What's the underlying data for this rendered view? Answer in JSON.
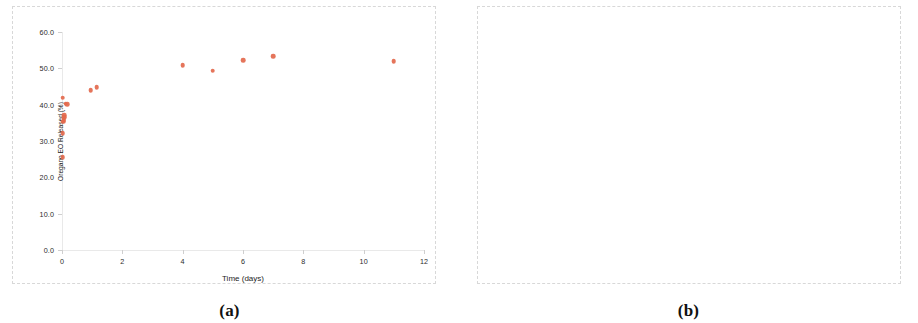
{
  "figure": {
    "marker_color": "#e3694d",
    "background": "#ffffff",
    "panels": [
      {
        "caption": "(a)",
        "chart_data": {
          "type": "scatter",
          "title": "",
          "xlabel": "Time (days)",
          "ylabel": "Oregano EO Released (%)",
          "xlim": [
            0,
            12
          ],
          "ylim": [
            0,
            60
          ],
          "xticks": [
            "0",
            "2",
            "4",
            "6",
            "8",
            "10",
            "12"
          ],
          "xtick_values": [
            0,
            2,
            4,
            6,
            8,
            10,
            12
          ],
          "yticks": [
            "0.0",
            "10.0",
            "20.0",
            "30.0",
            "40.0",
            "50.0",
            "60.0"
          ],
          "ytick_values": [
            0,
            10,
            20,
            30,
            40,
            50,
            60
          ],
          "grid": false,
          "legend": "none",
          "marker": "circle",
          "series": [
            {
              "name": "Oregano EO release",
              "points": [
                [
                  0.02,
                  25.5
                ],
                [
                  0.03,
                  32.2
                ],
                [
                  0.04,
                  35.3
                ],
                [
                  0.05,
                  35.6
                ],
                [
                  0.06,
                  36.0
                ],
                [
                  0.07,
                  36.6
                ],
                [
                  0.08,
                  37.1
                ],
                [
                  0.03,
                  41.9
                ],
                [
                  0.12,
                  40.3
                ],
                [
                  0.18,
                  40.2
                ],
                [
                  0.95,
                  44.0
                ],
                [
                  1.15,
                  44.8
                ],
                [
                  4.0,
                  50.9
                ],
                [
                  5.0,
                  49.4
                ],
                [
                  6.0,
                  52.2
                ],
                [
                  7.0,
                  53.4
                ],
                [
                  11.0,
                  51.9
                ]
              ]
            }
          ]
        }
      },
      {
        "caption": "(b)",
        "chart_data": {
          "type": "scatter",
          "title": "",
          "xlabel": "Time (hours)",
          "ylabel": "Oregano EO Released (%)",
          "xlim": [
            0,
            2
          ],
          "ylim": [
            0,
            50
          ],
          "xticks": [
            "0.0",
            "0.5",
            "1.0",
            "1.5",
            "2.0"
          ],
          "xtick_values": [
            0,
            0.5,
            1.0,
            1.5,
            2.0
          ],
          "yticks": [
            "0.0",
            "10.0",
            "20.0",
            "30.0",
            "40.0",
            "50.0"
          ],
          "ytick_values": [
            0,
            10,
            20,
            30,
            40,
            50
          ],
          "grid": false,
          "legend": "none",
          "marker": "diamond",
          "series": [
            {
              "name": "Oregano EO release",
              "points": [
                [
                  0.0,
                  25.6
                ],
                [
                  0.33,
                  42.1
                ],
                [
                  0.67,
                  32.4
                ],
                [
                  1.0,
                  35.5
                ],
                [
                  1.75,
                  35.0
                ]
              ]
            }
          ]
        }
      }
    ]
  }
}
